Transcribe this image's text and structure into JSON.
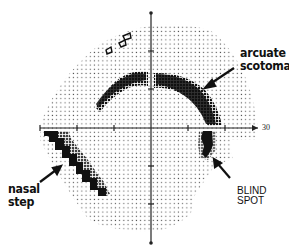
{
  "figure": {
    "axis": {
      "x_end_label": "30",
      "center": {
        "x": 151,
        "y": 128
      }
    },
    "annotations": {
      "arcuate_line1": "arcuate",
      "arcuate_line2": "scotoma",
      "nasal_line1": "nasal",
      "nasal_line2": "step",
      "blind_line1": "BLIND",
      "blind_line2": "SPOT"
    },
    "colors": {
      "ink": "#111111",
      "dot": "#555555",
      "background": "#ffffff"
    }
  }
}
